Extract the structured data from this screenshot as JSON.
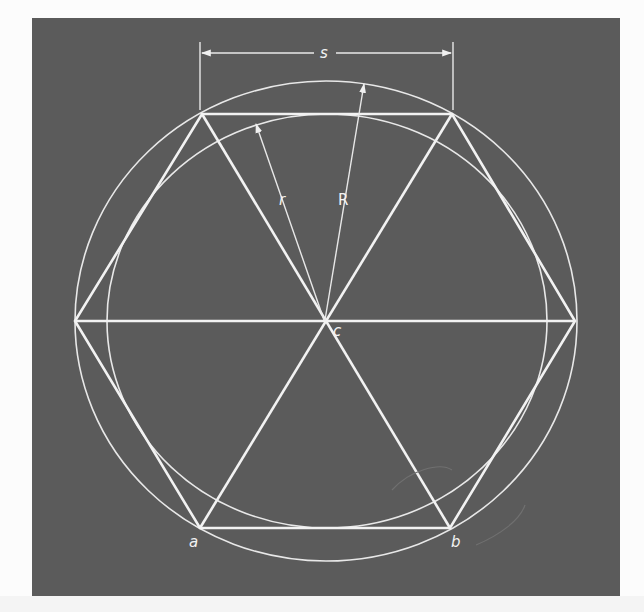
{
  "figure": {
    "background_color": "#5b5b5b",
    "line_color": "#f0f0f0",
    "labels": {
      "side": "s",
      "inner_radius": "r",
      "outer_radius": "R",
      "center": "c",
      "vertex_a": "a",
      "vertex_b": "b"
    },
    "geometry": {
      "center": [
        325,
        321
      ],
      "outer_circle_radius": 250,
      "inner_circle_radius": 213,
      "hexagon_vertices": [
        [
          202,
          114
        ],
        [
          452,
          114
        ],
        [
          575,
          321
        ],
        [
          450,
          528
        ],
        [
          200,
          528
        ],
        [
          75,
          321
        ]
      ],
      "dimension_line_y": 48
    }
  }
}
